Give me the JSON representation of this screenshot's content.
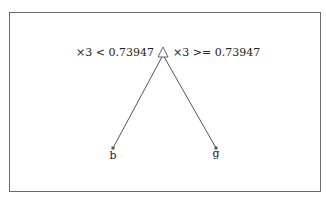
{
  "tree": {
    "root": {
      "split_left": "×3 < 0.73947",
      "split_right": "×3 >= 0.73947",
      "marker": "triangle"
    },
    "leaves": [
      {
        "label": "b"
      },
      {
        "label": "g"
      }
    ]
  },
  "colors": {
    "line": "#555555",
    "node": "#555555",
    "border": "#6a6a6a"
  }
}
